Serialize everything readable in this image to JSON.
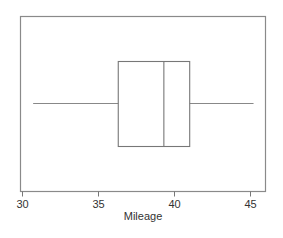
{
  "chart_data": {
    "type": "box",
    "title": "",
    "xlabel": "Mileage",
    "ylabel": "",
    "orientation": "horizontal",
    "xlim": [
      29.9,
      46.3
    ],
    "xticks": [
      30,
      35,
      40,
      45
    ],
    "xtick_labels": [
      "30",
      "35",
      "40",
      "45"
    ],
    "grid": false,
    "series": [
      {
        "name": "Mileage",
        "min": 30.7,
        "q1": 36.3,
        "median": 39.3,
        "q3": 41.0,
        "max": 45.2
      }
    ]
  },
  "colors": {
    "frame": "#8a8a8a",
    "box": "#777777",
    "text": "#333333"
  }
}
